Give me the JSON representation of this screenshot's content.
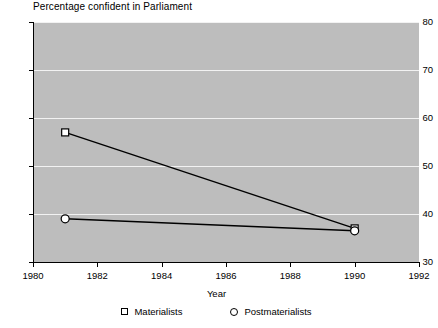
{
  "chart_data": {
    "type": "line",
    "title": "Percentage confident in Parliament",
    "xlabel": "Year",
    "ylabel": "",
    "x": [
      1981,
      1990
    ],
    "xlim": [
      1980,
      1992
    ],
    "ylim": [
      30,
      80
    ],
    "xticks": [
      1980,
      1982,
      1984,
      1986,
      1988,
      1990,
      1992
    ],
    "yticks": [
      30,
      40,
      50,
      60,
      70,
      80
    ],
    "grid": true,
    "legend_position": "bottom",
    "plot_background": "#bdbdbd",
    "gridline_color": "#f2f2f2",
    "line_color": "#000000",
    "marker_fill": "#ffffff",
    "series": [
      {
        "name": "Materialists",
        "marker": "square",
        "values": [
          57,
          37
        ]
      },
      {
        "name": "Postmaterialists",
        "marker": "circle",
        "values": [
          39,
          36.5
        ]
      }
    ]
  },
  "legend": {
    "items": [
      {
        "label": "Materialists",
        "marker": "square"
      },
      {
        "label": "Postmaterialists",
        "marker": "circle"
      }
    ]
  }
}
